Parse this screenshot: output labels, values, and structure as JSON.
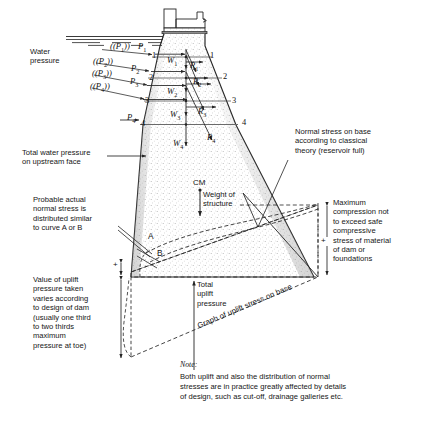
{
  "figure": {
    "type": "engineering-diagram"
  },
  "water": {
    "label": "Water\npressure",
    "pressure_ordinates": [
      "(P1)",
      "(P2)",
      "(P3)",
      "(P4)"
    ],
    "resultants": [
      "P1",
      "P2",
      "P3",
      "P4"
    ]
  },
  "forces": {
    "weights": [
      "W1",
      "W2",
      "W3",
      "W4"
    ],
    "reactions": [
      "R1",
      "R2",
      "R3",
      "R4"
    ],
    "section_numbers": [
      "1",
      "2",
      "3",
      "4"
    ]
  },
  "centroid": {
    "marker": "CM",
    "label": "Weight of\nstructure"
  },
  "curves": {
    "a": "A",
    "b": "B"
  },
  "annotations": {
    "total_water_pressure": "Total water pressure\non upstream face",
    "probable_actual": "Probable actual\nnormal stress is\ndistributed similar\nto curve A or B",
    "uplift_value": "Value of uplift\npressure taken\nvaries according\nto design of dam\n(usually one third\nto two thirds\nmaximum\npressure at toe)",
    "normal_stress_base": "Normal stress on base\naccording to classical\ntheory (reservoir full)",
    "max_compression": "Maximum\ncompression not\nto exceed safe\ncompressive\nstress of material\nof dam or\nfoundations",
    "total_uplift": "Total\nuplift\npressure",
    "graph_uplift": "Graph of uplift stress on base"
  },
  "note": {
    "title": "Note:",
    "body": "Both uplift and also the distribution of normal\nstresses are in practice greatly affected by details\nof design, such as cut-off, drainage galleries etc."
  },
  "signs": {
    "plus_top": "+",
    "plus_right": "+"
  },
  "colors": {
    "ink": "#1a1a1a",
    "line": "#242424",
    "hatch": "#9a9a9a",
    "background": "#ffffff"
  }
}
